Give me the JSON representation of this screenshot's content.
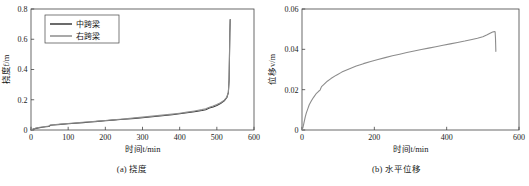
{
  "figure": {
    "panels": [
      {
        "id": "a",
        "caption": "(a) 挠度",
        "xlabel": "时间t/min",
        "ylabel": "挠度f/m"
      },
      {
        "id": "b",
        "caption": "(b) 水平位移",
        "xlabel": "时间t/min",
        "ylabel": "位移v/m"
      }
    ]
  },
  "colors": {
    "series_mid": "#3a3a3a",
    "series_right": "#8c8c8c",
    "axis": "#444444",
    "text": "#1a1a1a"
  },
  "chart_data": [
    {
      "type": "line",
      "panel": "a",
      "title": "(a) 挠度",
      "xlabel": "时间t/min",
      "ylabel": "挠度f/m",
      "xlim": [
        0,
        600
      ],
      "ylim": [
        0,
        0.8
      ],
      "xticks": [
        0,
        100,
        200,
        300,
        400,
        500,
        600
      ],
      "yticks": [
        0,
        0.2,
        0.4,
        0.6,
        0.8
      ],
      "xticklabels": [
        "0",
        "100",
        "200",
        "300",
        "400",
        "500",
        "600"
      ],
      "yticklabels": [
        "0",
        "0.2",
        "0.4",
        "0.6",
        "0.8"
      ],
      "grid": false,
      "legend": {
        "position": "upper-left",
        "entries": [
          "中跨梁",
          "右跨梁"
        ]
      },
      "series": [
        {
          "name": "中跨梁",
          "color": "#3a3a3a",
          "x": [
            0,
            10,
            20,
            30,
            40,
            48,
            52,
            60,
            80,
            100,
            120,
            140,
            160,
            180,
            200,
            220,
            240,
            260,
            280,
            300,
            320,
            340,
            360,
            380,
            400,
            420,
            440,
            460,
            470,
            480,
            490,
            500,
            510,
            520,
            527,
            531,
            533,
            534,
            535,
            536
          ],
          "y": [
            0.0,
            0.009,
            0.014,
            0.018,
            0.021,
            0.023,
            0.031,
            0.033,
            0.037,
            0.041,
            0.045,
            0.049,
            0.053,
            0.057,
            0.061,
            0.065,
            0.069,
            0.073,
            0.077,
            0.081,
            0.086,
            0.091,
            0.096,
            0.101,
            0.107,
            0.114,
            0.121,
            0.129,
            0.134,
            0.145,
            0.152,
            0.162,
            0.175,
            0.193,
            0.215,
            0.247,
            0.33,
            0.48,
            0.64,
            0.73
          ]
        },
        {
          "name": "右跨梁",
          "color": "#8c8c8c",
          "x": [
            0,
            10,
            20,
            30,
            40,
            48,
            52,
            60,
            80,
            100,
            120,
            140,
            160,
            180,
            200,
            220,
            240,
            260,
            280,
            300,
            320,
            340,
            360,
            380,
            400,
            420,
            440,
            460,
            470,
            480,
            490,
            500,
            510,
            520,
            527,
            531,
            533,
            534,
            535,
            536
          ],
          "y": [
            0.0,
            0.01,
            0.016,
            0.02,
            0.023,
            0.026,
            0.033,
            0.035,
            0.039,
            0.043,
            0.047,
            0.051,
            0.055,
            0.059,
            0.063,
            0.067,
            0.071,
            0.075,
            0.08,
            0.085,
            0.09,
            0.095,
            0.1,
            0.105,
            0.111,
            0.118,
            0.126,
            0.135,
            0.141,
            0.15,
            0.158,
            0.168,
            0.18,
            0.197,
            0.218,
            0.25,
            0.34,
            0.49,
            0.65,
            0.73
          ]
        }
      ],
      "annotations": [
        "curve rises slowly then spikes vertically near t=533 min to f=0.73 m"
      ]
    },
    {
      "type": "line",
      "panel": "b",
      "title": "(b) 水平位移",
      "xlabel": "时间t/min",
      "ylabel": "位移v/m",
      "xlim": [
        0,
        600
      ],
      "ylim": [
        0,
        0.06
      ],
      "xticks": [
        0,
        200,
        400,
        600
      ],
      "yticks": [
        0,
        0.02,
        0.04,
        0.06
      ],
      "xticklabels": [
        "0",
        "200",
        "400",
        "600"
      ],
      "yticklabels": [
        "0",
        "0.02",
        "0.04",
        "0.06"
      ],
      "grid": false,
      "legend": null,
      "series": [
        {
          "name": "位移",
          "color": "#8c8c8c",
          "x": [
            0,
            3,
            6,
            9,
            12,
            16,
            20,
            26,
            32,
            40,
            46,
            50,
            54,
            60,
            70,
            80,
            95,
            110,
            130,
            150,
            170,
            190,
            210,
            230,
            250,
            270,
            290,
            310,
            330,
            350,
            370,
            390,
            410,
            430,
            450,
            470,
            485,
            500,
            512,
            520,
            527,
            532,
            534,
            535,
            536
          ],
          "y": [
            0.0,
            0.0015,
            0.004,
            0.0065,
            0.0085,
            0.0105,
            0.0125,
            0.0145,
            0.0162,
            0.0182,
            0.0192,
            0.0198,
            0.0215,
            0.0225,
            0.0242,
            0.0255,
            0.0272,
            0.0287,
            0.0303,
            0.0317,
            0.0329,
            0.034,
            0.035,
            0.0359,
            0.0368,
            0.0376,
            0.0384,
            0.0392,
            0.0399,
            0.0406,
            0.0413,
            0.042,
            0.0427,
            0.0434,
            0.0441,
            0.0449,
            0.0455,
            0.0462,
            0.0472,
            0.048,
            0.0486,
            0.0488,
            0.0487,
            0.0455,
            0.039
          ]
        }
      ],
      "annotations": [
        "concave rise to about 0.0488 m then abrupt drop to 0.039 m at t≈535 min"
      ]
    }
  ]
}
